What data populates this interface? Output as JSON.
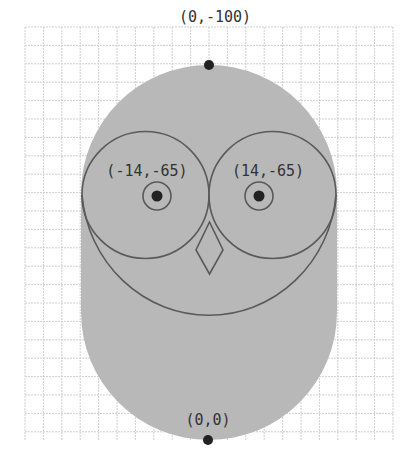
{
  "diagram": {
    "type": "owl-coordinate-sketch",
    "colors": {
      "background": "#ffffff",
      "grid": "#cfcfcf",
      "body_fill": "#b8b8b8",
      "outline": "#5a5a5a",
      "dot": "#222222",
      "label": "#333333"
    },
    "grid": {
      "x0": 25,
      "y0": 27,
      "x1": 393,
      "y1": 440,
      "step": 18.4
    },
    "body": {
      "cx": 209,
      "top_cy": 193,
      "bottom_cy": 312,
      "r": 128
    },
    "eyes": [
      {
        "cx": 145.5,
        "cy": 195,
        "r": 63.5,
        "pupil_cx": 157,
        "pupil_cy": 196,
        "ring_r": 14,
        "dot_r": 5.5
      },
      {
        "cx": 272.5,
        "cy": 195,
        "r": 63.5,
        "pupil_cx": 259,
        "pupil_cy": 196,
        "ring_r": 14,
        "dot_r": 5.5
      }
    ],
    "beak": {
      "points": "209.5,222 223,250 209.5,274 196,250"
    },
    "chin_arc": {
      "d": "M 82 195 A 127.5 132 0 0 0 336 195"
    },
    "points": [
      {
        "label": "(0,-100)",
        "x": 209,
        "y": 65,
        "tx": 215,
        "ty": 22
      },
      {
        "label": "(0,0)",
        "x": 208,
        "y": 440,
        "tx": 208,
        "ty": 425
      }
    ],
    "labels": {
      "top_point": "(0,-100)",
      "left_eye": "(-14,-65)",
      "right_eye": "(14,-65)",
      "origin": "(0,0)"
    }
  }
}
